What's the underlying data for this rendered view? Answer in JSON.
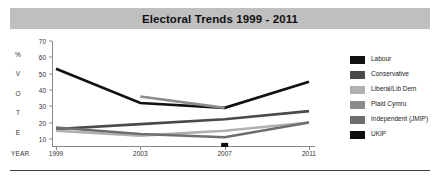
{
  "title": "Electoral Trends 1999 - 2011",
  "vertical_axis_letters": [
    "%",
    "V",
    "O",
    "T",
    "E"
  ],
  "year_axis_label": "YEAR",
  "legend": {
    "items": [
      {
        "label": "Labour",
        "color": "#111111"
      },
      {
        "label": "Conservative",
        "color": "#4a4a4a"
      },
      {
        "label": "Liberal/Lib Dem",
        "color": "#b0b0b0"
      },
      {
        "label": "Plaid Cymru",
        "color": "#8c8c8c"
      },
      {
        "label": "Independent (JMIP)",
        "color": "#6e6e6e"
      },
      {
        "label": "UKIP",
        "color": "#0d0d0d"
      }
    ]
  },
  "chart_data": {
    "type": "line",
    "title": "Electoral Trends 1999 - 2011",
    "xlabel": "YEAR",
    "ylabel": "% VOTE",
    "x": [
      1999,
      2003,
      2007,
      2011
    ],
    "categories": [
      "1999",
      "2003",
      "2007",
      "2011"
    ],
    "xlim": [
      1999,
      2011
    ],
    "ylim": [
      5,
      70
    ],
    "yticks": [
      10,
      20,
      30,
      40,
      50,
      60,
      70
    ],
    "grid": false,
    "legend_position": "right",
    "series": [
      {
        "name": "Labour",
        "color": "#111111",
        "x": [
          1999,
          2003,
          2007,
          2011
        ],
        "values": [
          53,
          32,
          29,
          45
        ]
      },
      {
        "name": "Conservative",
        "color": "#4a4a4a",
        "x": [
          1999,
          2003,
          2007,
          2011
        ],
        "values": [
          16,
          19,
          22,
          27
        ]
      },
      {
        "name": "Liberal/Lib Dem",
        "color": "#b0b0b0",
        "x": [
          1999,
          2003,
          2007,
          2011
        ],
        "values": [
          15,
          12,
          15,
          20
        ]
      },
      {
        "name": "Plaid Cymru",
        "color": "#8c8c8c",
        "x": [
          2003,
          2007
        ],
        "values": [
          36,
          29
        ]
      },
      {
        "name": "Independent (JMIP)",
        "color": "#6e6e6e",
        "x": [
          1999,
          2003,
          2007,
          2011
        ],
        "values": [
          17,
          13,
          11,
          20
        ]
      },
      {
        "name": "UKIP",
        "color": "#0d0d0d",
        "x": [
          2007
        ],
        "values": [
          6
        ],
        "marker_only": true
      }
    ]
  }
}
